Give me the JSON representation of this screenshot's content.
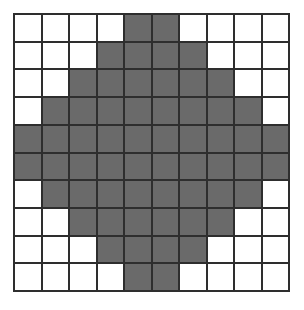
{
  "figure": {
    "name": "pixelated-circle-grid",
    "rows": 10,
    "columns": 10,
    "colors": {
      "filled": "#6a6a6a",
      "empty": "#ffffff",
      "gridline": "#2e2e2e",
      "background": "#ffffff"
    },
    "filled_count": 68,
    "empty_count": 32
  },
  "chart_data": {
    "type": "heatmap",
    "title": "",
    "xlabel": "",
    "ylabel": "",
    "categories_x": [
      "1",
      "2",
      "3",
      "4",
      "5",
      "6",
      "7",
      "8",
      "9",
      "10"
    ],
    "categories_y": [
      "1",
      "2",
      "3",
      "4",
      "5",
      "6",
      "7",
      "8",
      "9",
      "10"
    ],
    "legend": [],
    "grid": true,
    "value_labels": {
      "0": "empty",
      "1": "filled"
    },
    "matrix": [
      [
        0,
        0,
        0,
        0,
        1,
        1,
        0,
        0,
        0,
        0
      ],
      [
        0,
        0,
        0,
        1,
        1,
        1,
        1,
        0,
        0,
        0
      ],
      [
        0,
        0,
        1,
        1,
        1,
        1,
        1,
        1,
        0,
        0
      ],
      [
        0,
        1,
        1,
        1,
        1,
        1,
        1,
        1,
        1,
        0
      ],
      [
        1,
        1,
        1,
        1,
        1,
        1,
        1,
        1,
        1,
        1
      ],
      [
        1,
        1,
        1,
        1,
        1,
        1,
        1,
        1,
        1,
        1
      ],
      [
        0,
        1,
        1,
        1,
        1,
        1,
        1,
        1,
        1,
        0
      ],
      [
        0,
        0,
        1,
        1,
        1,
        1,
        1,
        1,
        0,
        0
      ],
      [
        0,
        0,
        0,
        1,
        1,
        1,
        1,
        0,
        0,
        0
      ],
      [
        0,
        0,
        0,
        0,
        1,
        1,
        0,
        0,
        0,
        0
      ]
    ],
    "row_filled_counts": [
      2,
      4,
      6,
      8,
      10,
      10,
      8,
      6,
      4,
      2
    ]
  }
}
